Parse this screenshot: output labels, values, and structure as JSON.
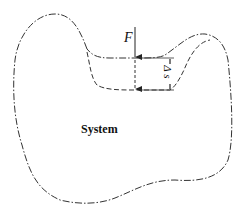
{
  "diagram": {
    "title": "",
    "labels": {
      "force": "F",
      "system": "System",
      "displacement": "Δ s"
    },
    "elements": [
      {
        "type": "boundary",
        "style": "dash-dot",
        "description": "original system boundary"
      },
      {
        "type": "boundary",
        "style": "dashed",
        "description": "displaced boundary after force application"
      },
      {
        "type": "arrow",
        "label": "F",
        "direction": "down"
      },
      {
        "type": "dimension",
        "label": "Δ s",
        "orientation": "vertical"
      }
    ],
    "colors": {
      "line": "#333333",
      "background": "#ffffff"
    }
  }
}
